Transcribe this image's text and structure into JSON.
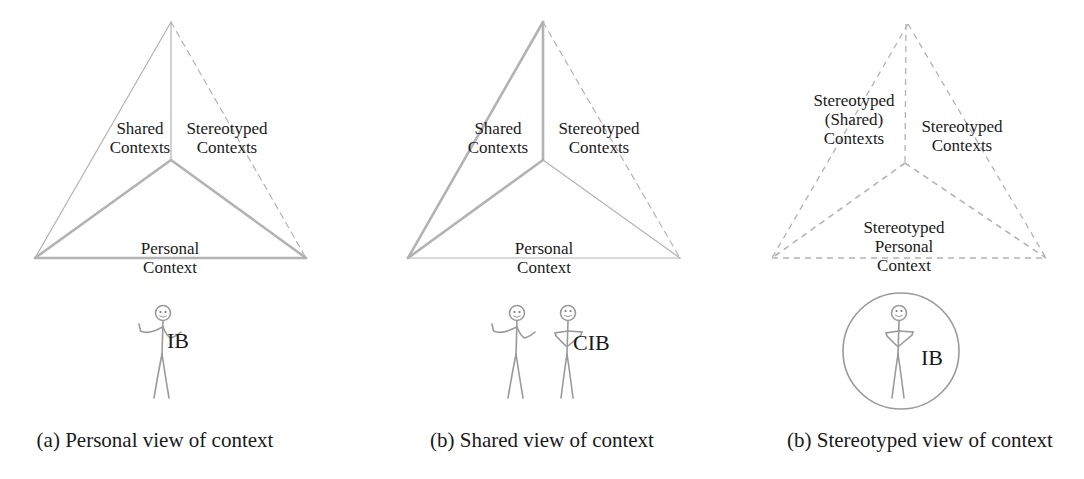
{
  "colors": {
    "line": "#b3b3b3",
    "text": "#1a1a1a"
  },
  "panels": [
    {
      "id": "a",
      "labels": {
        "shared": "Shared\nContexts",
        "stereotyped": "Stereotyped\nContexts",
        "personal": "Personal\nContext"
      },
      "figure_label": "IB",
      "caption": "(a) Personal view of context"
    },
    {
      "id": "b",
      "labels": {
        "shared": "Shared\nContexts",
        "stereotyped": "Stereotyped\nContexts",
        "personal": "Personal\nContext"
      },
      "figure_label": "CIB",
      "caption": "(b) Shared view of context"
    },
    {
      "id": "c",
      "labels": {
        "shared": "Stereotyped\n(Shared)\nContexts",
        "stereotyped": "Stereotyped\nContexts",
        "personal": "Stereotyped\nPersonal\nContext"
      },
      "figure_label": "IB",
      "caption": "(b) Stereotyped view of context"
    }
  ]
}
